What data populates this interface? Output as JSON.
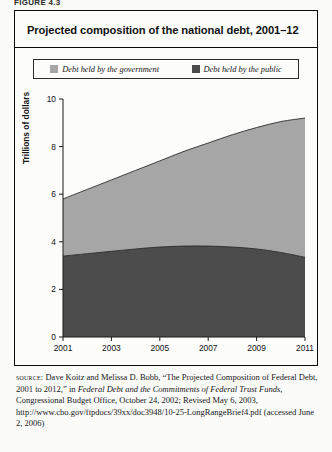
{
  "figure": {
    "label": "FIGURE 4.3",
    "title": "Projected composition of the national debt, 2001–12"
  },
  "legend": {
    "items": [
      {
        "label": "Debt held by the government",
        "color": "#a6a6a6",
        "key": "government"
      },
      {
        "label": "Debt held by the public",
        "color": "#4c4c4c",
        "key": "public"
      }
    ]
  },
  "source": {
    "keyword": "source:",
    "text_1": " Dave Koitz and Melissa D. Bobb, “The Projected Composition of Federal Debt, 2001 to 2012,” in ",
    "italic_1": "Federal Debt and the Commitments of Federal Trust Funds",
    "text_2": ", Congressional Budget Office, October 24, 2002; Revised May 6, 2003, http://www.cbo.gov/ftpdocs/39xx/doc3948/10-25-LongRangeBrief4.pdf (accessed June 2, 2006)"
  },
  "chart_data": {
    "type": "area",
    "stacked": true,
    "title": "Projected composition of the national debt, 2001–12",
    "xlabel": "",
    "ylabel": "Trillions of dollars",
    "xlim": [
      2001,
      2011
    ],
    "ylim": [
      0,
      10
    ],
    "ytick_values": [
      0,
      2,
      4,
      6,
      8,
      10
    ],
    "ytick_labels": [
      "0",
      "2",
      "4",
      "6",
      "8",
      "10"
    ],
    "xtick_values": [
      2001,
      2003,
      2005,
      2007,
      2009,
      2011
    ],
    "xtick_labels": [
      "2001",
      "2003",
      "2005",
      "2007",
      "2009",
      "2011"
    ],
    "grid": false,
    "legend_position": "top",
    "x": [
      2001,
      2002,
      2003,
      2004,
      2005,
      2006,
      2007,
      2008,
      2009,
      2010,
      2011
    ],
    "series": [
      {
        "name": "Debt held by the public",
        "color": "#4c4c4c",
        "values": [
          3.4,
          3.5,
          3.6,
          3.7,
          3.78,
          3.82,
          3.82,
          3.78,
          3.7,
          3.55,
          3.35
        ]
      },
      {
        "name": "Debt held by the government",
        "color": "#a6a6a6",
        "values": [
          2.4,
          2.7,
          3.0,
          3.3,
          3.62,
          3.98,
          4.33,
          4.72,
          5.1,
          5.5,
          5.85
        ]
      }
    ],
    "totals": [
      5.8,
      6.2,
      6.6,
      7.0,
      7.4,
      7.8,
      8.15,
      8.5,
      8.8,
      9.05,
      9.2
    ]
  }
}
